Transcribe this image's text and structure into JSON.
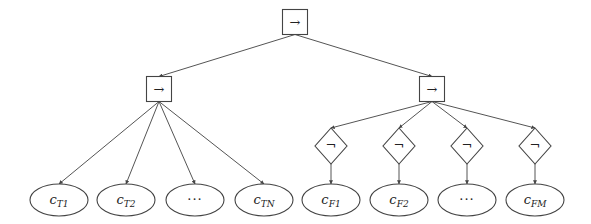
{
  "diagram": {
    "type": "tree",
    "root": {
      "id": "root",
      "shape": "box",
      "label": "→",
      "cx": 295,
      "cy": 22
    },
    "level1": [
      {
        "id": "imp_left",
        "shape": "box",
        "label": "→",
        "cx": 159,
        "cy": 89
      },
      {
        "id": "imp_right",
        "shape": "box",
        "label": "→",
        "cx": 432,
        "cy": 89
      }
    ],
    "negations": [
      {
        "id": "neg1",
        "shape": "diamond",
        "label": "¬",
        "cx": 331,
        "cy": 146
      },
      {
        "id": "neg2",
        "shape": "diamond",
        "label": "¬",
        "cx": 399,
        "cy": 146
      },
      {
        "id": "neg3",
        "shape": "diamond",
        "label": "¬",
        "cx": 467,
        "cy": 146
      },
      {
        "id": "neg4",
        "shape": "diamond",
        "label": "¬",
        "cx": 535,
        "cy": 146
      }
    ],
    "leaves_true": [
      {
        "id": "cT1",
        "base": "c",
        "sub": "T1",
        "cx": 59,
        "cy": 200
      },
      {
        "id": "cT2",
        "base": "c",
        "sub": "T2",
        "cx": 126,
        "cy": 200
      },
      {
        "id": "cTdots",
        "base": "···",
        "sub": "",
        "cx": 195,
        "cy": 200
      },
      {
        "id": "cTN",
        "base": "c",
        "sub": "TN",
        "cx": 264,
        "cy": 200
      }
    ],
    "leaves_false": [
      {
        "id": "cF1",
        "base": "c",
        "sub": "F1",
        "cx": 331,
        "cy": 200
      },
      {
        "id": "cF2",
        "base": "c",
        "sub": "F2",
        "cx": 399,
        "cy": 200
      },
      {
        "id": "cFdots",
        "base": "···",
        "sub": "",
        "cx": 467,
        "cy": 200
      },
      {
        "id": "cFM",
        "base": "c",
        "sub": "FM",
        "cx": 535,
        "cy": 200
      }
    ],
    "colors": {
      "stroke": "#444444",
      "edge": "#555555",
      "background": "#ffffff",
      "text": "#222222"
    }
  }
}
